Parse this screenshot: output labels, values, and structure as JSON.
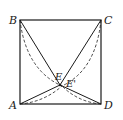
{
  "figure": {
    "type": "geometry-diagram",
    "points": {
      "A": {
        "label": "A",
        "x": 20,
        "y": 104
      },
      "B": {
        "label": "B",
        "x": 20,
        "y": 20
      },
      "C": {
        "label": "C",
        "x": 101,
        "y": 20
      },
      "D": {
        "label": "D",
        "x": 101,
        "y": 104
      },
      "E": {
        "label": "E",
        "x": 60,
        "y": 85
      },
      "E_prime": {
        "label": "E'",
        "x": 62,
        "y": 86
      }
    },
    "labels": {
      "A": "A",
      "B": "B",
      "C": "C",
      "D": "D",
      "E": "E",
      "E_prime": "E'"
    },
    "colors": {
      "stroke": "#1a1a1a",
      "background": "#ffffff"
    }
  }
}
